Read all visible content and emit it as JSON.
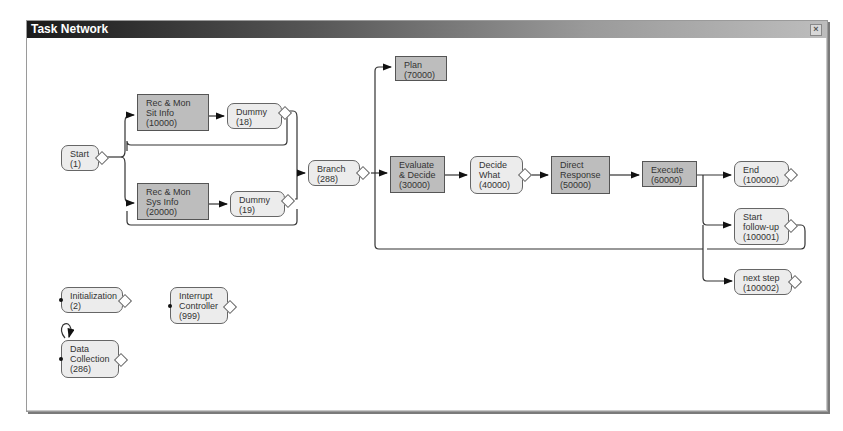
{
  "window": {
    "title": "Task Network",
    "close_label": "×"
  },
  "nodes": {
    "start": {
      "lines": [
        "Start",
        "(1)"
      ]
    },
    "rec_sit": {
      "lines": [
        "Rec & Mon",
        "Sit Info",
        "(10000)"
      ]
    },
    "dummy18": {
      "lines": [
        "Dummy",
        "(18)"
      ]
    },
    "rec_sys": {
      "lines": [
        "Rec & Mon",
        "Sys Info",
        "(20000)"
      ]
    },
    "dummy19": {
      "lines": [
        "Dummy",
        "(19)"
      ]
    },
    "branch": {
      "lines": [
        "Branch",
        "(288)"
      ]
    },
    "plan": {
      "lines": [
        "Plan",
        "(70000)"
      ]
    },
    "evaluate": {
      "lines": [
        "Evaluate",
        "& Decide",
        "(30000)"
      ]
    },
    "decide_what": {
      "lines": [
        "Decide",
        "What",
        "(40000)"
      ]
    },
    "direct_response": {
      "lines": [
        "Direct",
        "Response",
        "(50000)"
      ]
    },
    "execute": {
      "lines": [
        "Execute",
        "(60000)"
      ]
    },
    "end": {
      "lines": [
        "End",
        "(100000)"
      ]
    },
    "start_followup": {
      "lines": [
        "Start",
        "follow-up",
        "(100001)"
      ]
    },
    "next_step": {
      "lines": [
        "next step",
        "(100002)"
      ]
    },
    "initialization": {
      "lines": [
        "Initialization",
        "(2)"
      ]
    },
    "interrupt": {
      "lines": [
        "Interrupt",
        "Controller",
        "(999)"
      ]
    },
    "data_collection": {
      "lines": [
        "Data",
        "Collection",
        "(286)"
      ]
    }
  }
}
